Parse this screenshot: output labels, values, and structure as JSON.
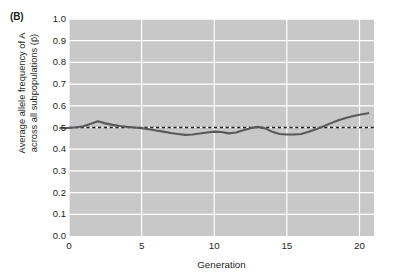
{
  "panel": {
    "label": "(B)"
  },
  "chart_data": {
    "type": "line",
    "title": "",
    "xlabel": "Generation",
    "ylabel": "Average allele frequency of A\nacross all subpopulations (p̄)",
    "xlim": [
      0,
      21
    ],
    "ylim": [
      0.0,
      1.0
    ],
    "grid": true,
    "legend": "none",
    "plot_background": "#c8c8c8",
    "gridline_color": "#ffffff",
    "line_color": "#58595b",
    "reference_line_color": "#231f20",
    "xticks": [
      0,
      5,
      10,
      15,
      20
    ],
    "xtick_labels": [
      "0",
      "5",
      "10",
      "15",
      "20"
    ],
    "yticks": [
      0.0,
      0.1,
      0.2,
      0.3,
      0.4,
      0.5,
      0.6,
      0.7,
      0.8,
      0.9,
      1.0
    ],
    "ytick_labels": [
      "0.0",
      "0.1",
      "0.2",
      "0.3",
      "0.4",
      "0.5",
      "0.6",
      "0.7",
      "0.8",
      "0.9",
      "1.0"
    ],
    "reference_line": {
      "y": 0.5,
      "style": "dashed"
    },
    "x": [
      -0.6,
      0,
      0.5,
      1,
      1.5,
      2,
      2.5,
      3,
      3.5,
      4,
      4.5,
      5,
      5.5,
      6,
      6.5,
      7,
      7.5,
      8,
      8.5,
      9,
      9.5,
      10,
      10.5,
      11,
      11.5,
      12,
      12.5,
      13,
      13.5,
      14,
      14.5,
      15,
      15.5,
      16,
      16.5,
      17,
      17.5,
      18,
      18.5,
      19,
      19.5,
      20,
      20.6
    ],
    "values": [
      0.497,
      0.498,
      0.501,
      0.506,
      0.517,
      0.529,
      0.519,
      0.512,
      0.507,
      0.503,
      0.5,
      0.497,
      0.492,
      0.486,
      0.481,
      0.475,
      0.47,
      0.466,
      0.468,
      0.472,
      0.477,
      0.481,
      0.479,
      0.473,
      0.477,
      0.487,
      0.497,
      0.503,
      0.496,
      0.48,
      0.47,
      0.468,
      0.468,
      0.47,
      0.48,
      0.492,
      0.505,
      0.519,
      0.532,
      0.543,
      0.552,
      0.559,
      0.566
    ]
  }
}
